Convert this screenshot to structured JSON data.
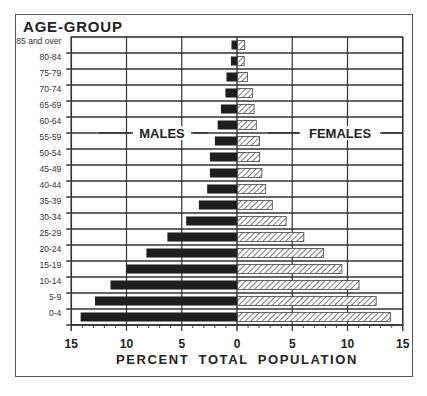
{
  "chart_data": {
    "type": "bar",
    "subtype": "population-pyramid",
    "title": "AGE-GROUP",
    "xlabel": "PERCENT  TOTAL POPULATION",
    "ylabel": "AGE-GROUP",
    "xlim": [
      -15,
      15
    ],
    "x_ticks": [
      "15",
      "10",
      "5",
      "0",
      "5",
      "10",
      "15"
    ],
    "grid": true,
    "legend": [
      "MALES",
      "FEMALES"
    ],
    "categories": [
      "85 and over",
      "80-84",
      "75-79",
      "70-74",
      "65-69",
      "60-64",
      "55-59",
      "50-54",
      "45-49",
      "40-44",
      "35-39",
      "30-34",
      "25-29",
      "20-24",
      "15-19",
      "10-14",
      "5-9",
      "0-4"
    ],
    "series": [
      {
        "name": "MALES",
        "side": "left",
        "fill": "solid",
        "color": "#1e1e1e",
        "values": [
          0.5,
          0.55,
          0.95,
          1.05,
          1.45,
          1.75,
          2.0,
          2.45,
          2.45,
          2.7,
          3.45,
          4.6,
          6.3,
          8.2,
          10.0,
          11.45,
          12.85,
          14.15
        ]
      },
      {
        "name": "FEMALES",
        "side": "right",
        "fill": "hatched",
        "color": "#555555",
        "values": [
          0.65,
          0.6,
          0.9,
          1.35,
          1.5,
          1.7,
          2.0,
          2.0,
          2.2,
          2.55,
          3.15,
          4.4,
          6.0,
          7.8,
          9.45,
          11.0,
          12.55,
          13.85
        ]
      }
    ]
  }
}
